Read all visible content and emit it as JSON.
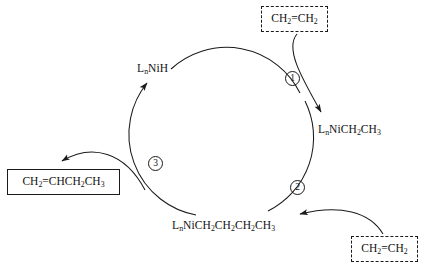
{
  "diagram": {
    "stroke_color": "#1a1a1a",
    "background_color": "#ffffff",
    "cycle": {
      "center_x": 225,
      "center_y": 140,
      "radius": 82,
      "direction": "clockwise"
    }
  },
  "species": [
    {
      "id": "nickel-hydride",
      "label": "LnNiH",
      "parts": [
        {
          "t": "L"
        },
        {
          "t": "n",
          "sub": true
        },
        {
          "t": "NiH"
        }
      ],
      "x": 137,
      "y": 62
    },
    {
      "id": "nickel-ethyl",
      "label": "LnNiCH2CH3",
      "parts": [
        {
          "t": "L"
        },
        {
          "t": "n",
          "sub": true
        },
        {
          "t": "NiCH"
        },
        {
          "t": "2",
          "sub": true
        },
        {
          "t": "CH"
        },
        {
          "t": "3",
          "sub": true
        }
      ],
      "x": 318,
      "y": 123
    },
    {
      "id": "nickel-butyl",
      "label": "LnNiCH2CH2CH2CH3",
      "parts": [
        {
          "t": "L"
        },
        {
          "t": "n",
          "sub": true
        },
        {
          "t": "NiCH"
        },
        {
          "t": "2",
          "sub": true
        },
        {
          "t": "CH"
        },
        {
          "t": "2",
          "sub": true
        },
        {
          "t": "CH"
        },
        {
          "t": "2",
          "sub": true
        },
        {
          "t": "CH"
        },
        {
          "t": "3",
          "sub": true
        }
      ],
      "x": 172,
      "y": 219
    }
  ],
  "reagent_boxes": [
    {
      "id": "ethylene-top",
      "label": "CH2=CH2",
      "parts": [
        {
          "t": "CH"
        },
        {
          "t": "2",
          "sub": true
        },
        {
          "t": "=CH"
        },
        {
          "t": "2",
          "sub": true
        }
      ],
      "x": 261,
      "y": 6,
      "width": 67,
      "height": 26,
      "border_style": "dashed"
    },
    {
      "id": "ethylene-bottom",
      "label": "CH2=CH2",
      "parts": [
        {
          "t": "CH"
        },
        {
          "t": "2",
          "sub": true
        },
        {
          "t": "=CH"
        },
        {
          "t": "2",
          "sub": true
        }
      ],
      "x": 351,
      "y": 236,
      "width": 67,
      "height": 26,
      "border_style": "dashed"
    }
  ],
  "product_boxes": [
    {
      "id": "butene-product",
      "label": "CH2=CHCH2CH3",
      "parts": [
        {
          "t": "CH"
        },
        {
          "t": "2",
          "sub": true
        },
        {
          "t": "=CHCH"
        },
        {
          "t": "2",
          "sub": true
        },
        {
          "t": "CH"
        },
        {
          "t": "3",
          "sub": true
        }
      ],
      "x": 7,
      "y": 169,
      "width": 113,
      "height": 26,
      "border_style": "solid"
    }
  ],
  "step_markers": [
    {
      "id": "step-1",
      "label": "①",
      "number": 1,
      "x": 285,
      "y": 71
    },
    {
      "id": "step-2",
      "label": "②",
      "number": 2,
      "x": 290,
      "y": 180
    },
    {
      "id": "step-3",
      "label": "③",
      "number": 3,
      "x": 148,
      "y": 156
    }
  ],
  "arrows": [
    {
      "id": "cycle-arc-butyl-to-hydride",
      "from": "nickel-butyl",
      "to": "nickel-hydride",
      "kind": "cycle-arc"
    },
    {
      "id": "cycle-arc-hydride-to-ethyl",
      "from": "nickel-hydride",
      "to": "nickel-ethyl",
      "kind": "cycle-arc"
    },
    {
      "id": "cycle-arc-ethyl-to-butyl",
      "from": "nickel-ethyl",
      "to": "nickel-butyl",
      "kind": "cycle-arc"
    },
    {
      "id": "ethylene-in-step-1",
      "from": "ethylene-top",
      "to": "nickel-ethyl",
      "kind": "reagent-in"
    },
    {
      "id": "ethylene-in-step-2",
      "from": "ethylene-bottom",
      "to": "nickel-butyl",
      "kind": "reagent-in"
    },
    {
      "id": "product-out-step-3",
      "from": "cycle",
      "to": "butene-product",
      "kind": "product-out"
    }
  ]
}
